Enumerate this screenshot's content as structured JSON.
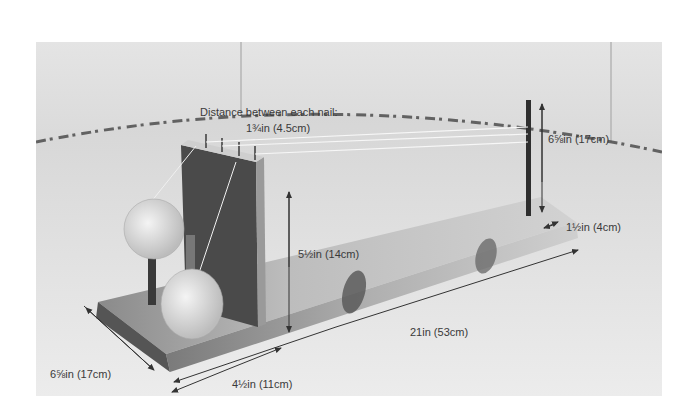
{
  "figure": {
    "palette": {
      "background": "#ffffff",
      "wall": "#e2e2e2",
      "table": "#dcdcdc",
      "table_edge_dark": "#2a2a2a",
      "wood_light": "#b8b8b8",
      "wood_dark": "#5a5a5a",
      "twine": "#efefef",
      "annotation": "#3a3a3a"
    }
  },
  "annotations": {
    "nail_spacing_title": "Distance between each nail:",
    "nail_spacing_value": "1¾in (4.5cm)",
    "dowel_height": "6⅝in (17cm)",
    "dowel_inset": "1½in (4cm)",
    "upright_height": "5½in (14cm)",
    "base_length": "21in (53cm)",
    "base_width": "6⅝in (17cm)",
    "upright_offset": "4½in (11cm)"
  }
}
